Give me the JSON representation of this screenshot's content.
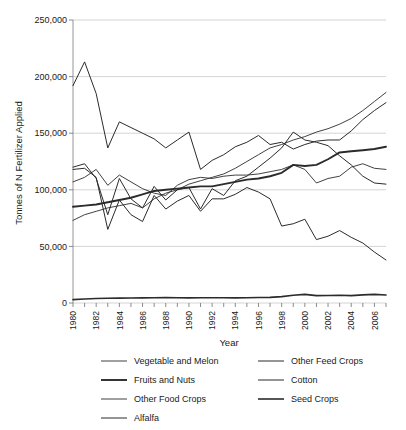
{
  "chart_data": {
    "type": "line",
    "title": "",
    "xlabel": "Year",
    "ylabel": "Tonnes of N Fertilizer Applied",
    "xlim": [
      1980,
      2007
    ],
    "ylim": [
      0,
      250000
    ],
    "grid": true,
    "legend_position": "bottom",
    "x": [
      1980,
      1981,
      1982,
      1983,
      1984,
      1985,
      1986,
      1987,
      1988,
      1989,
      1990,
      1991,
      1992,
      1993,
      1994,
      1995,
      1996,
      1997,
      1998,
      1999,
      2000,
      2001,
      2002,
      2003,
      2004,
      2005,
      2006,
      2007
    ],
    "ytick_labels": [
      "0",
      "50,000",
      "100,000",
      "150,000",
      "200,000",
      "250,000"
    ],
    "ytick_values": [
      0,
      50000,
      100000,
      150000,
      200000,
      250000
    ],
    "xtick_labels": [
      "1980",
      "1982",
      "1984",
      "1986",
      "1988",
      "1990",
      "1992",
      "1994",
      "1996",
      "1998",
      "2000",
      "2002",
      "2004",
      "2006"
    ],
    "xtick_values": [
      1980,
      1982,
      1984,
      1986,
      1988,
      1990,
      1992,
      1994,
      1996,
      1998,
      2000,
      2002,
      2004,
      2006
    ],
    "series": [
      {
        "name": "Vegetable and Melon",
        "stroke_width": 0.9,
        "values": [
          107000,
          111000,
          118000,
          104000,
          113000,
          107000,
          101000,
          97000,
          95000,
          104000,
          109000,
          111000,
          110000,
          112000,
          113000,
          113000,
          114000,
          116000,
          118000,
          122000,
          118000,
          106000,
          110000,
          112000,
          120000,
          123000,
          119000,
          118000
        ]
      },
      {
        "name": "Fruits and Nuts",
        "stroke_width": 1.9,
        "values": [
          85000,
          86000,
          87000,
          89000,
          91000,
          93000,
          96000,
          99000,
          100000,
          101000,
          102000,
          103000,
          103000,
          105000,
          107000,
          109000,
          110000,
          112000,
          115000,
          122000,
          121000,
          122000,
          127000,
          133000,
          134000,
          135000,
          136000,
          138000
        ]
      },
      {
        "name": "Other Food Crops",
        "stroke_width": 0.9,
        "values": [
          73000,
          78000,
          81000,
          84000,
          86000,
          88000,
          84000,
          92000,
          97000,
          100000,
          105000,
          108000,
          111000,
          114000,
          119000,
          125000,
          131000,
          137000,
          140000,
          144000,
          147000,
          151000,
          154000,
          158000,
          163000,
          170000,
          178000,
          186000
        ]
      },
      {
        "name": "Alfalfa",
        "stroke_width": 1.0,
        "values": [
          192000,
          213000,
          185000,
          137000,
          160000,
          155000,
          150000,
          145000,
          137000,
          144000,
          151000,
          118000,
          126000,
          131000,
          138000,
          142000,
          148000,
          140000,
          142000,
          136000,
          140000,
          143000,
          144000,
          144000,
          152000,
          162000,
          170000,
          177000
        ]
      },
      {
        "name": "Other Feed Crops",
        "stroke_width": 1.0,
        "values": [
          120000,
          123000,
          110000,
          78000,
          110000,
          92000,
          84000,
          103000,
          91000,
          100000,
          102000,
          83000,
          101000,
          95000,
          108000,
          112000,
          120000,
          128000,
          137000,
          151000,
          144000,
          142000,
          139000,
          130000,
          122000,
          112000,
          106000,
          105000
        ]
      },
      {
        "name": "Cotton",
        "stroke_width": 1.0,
        "values": [
          118000,
          119000,
          111000,
          65000,
          91000,
          78000,
          72000,
          95000,
          83000,
          90000,
          95000,
          81000,
          92000,
          92000,
          96000,
          102000,
          98000,
          92000,
          68000,
          70000,
          74000,
          56000,
          59000,
          64000,
          58000,
          53000,
          45000,
          38000
        ]
      },
      {
        "name": "Seed Crops",
        "stroke_width": 1.6,
        "values": [
          3000,
          3600,
          4000,
          4200,
          4300,
          4400,
          4500,
          4700,
          4800,
          4600,
          4500,
          4600,
          4700,
          4600,
          4500,
          4600,
          4800,
          5000,
          5600,
          6800,
          7600,
          6500,
          6600,
          6800,
          6500,
          7200,
          7600,
          7000
        ]
      }
    ]
  },
  "legend": {
    "left_column": [
      "Vegetable and Melon",
      "Fruits and Nuts",
      "Other Food Crops",
      "Alfalfa"
    ],
    "right_column": [
      "Other Feed Crops",
      "Cotton",
      "Seed Crops"
    ]
  }
}
